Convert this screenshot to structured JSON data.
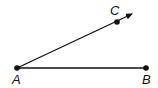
{
  "diagram": {
    "type": "angle",
    "points": [
      {
        "label": "A",
        "x": 17,
        "y": 68
      },
      {
        "label": "B",
        "x": 146,
        "y": 68
      },
      {
        "label": "C",
        "x": 117,
        "y": 22
      }
    ],
    "rays": [
      {
        "from": "A",
        "through": "C",
        "arrow": true
      }
    ],
    "segments": [
      {
        "from": "A",
        "to": "B"
      }
    ],
    "colors": {
      "stroke": "#111111",
      "background": "#ffffff"
    }
  }
}
